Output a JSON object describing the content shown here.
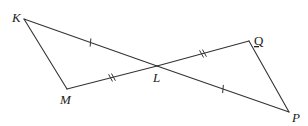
{
  "diagram": {
    "type": "geometry",
    "points": {
      "K": {
        "label": "K"
      },
      "M": {
        "label": "M"
      },
      "L": {
        "label": "L"
      },
      "Q": {
        "label": "Q"
      },
      "P": {
        "label": "P"
      }
    },
    "segments": [
      {
        "from": "K",
        "to": "L",
        "ticks": 1
      },
      {
        "from": "L",
        "to": "P",
        "ticks": 1
      },
      {
        "from": "M",
        "to": "L",
        "ticks": 2
      },
      {
        "from": "L",
        "to": "Q",
        "ticks": 2
      },
      {
        "from": "K",
        "to": "M",
        "ticks": 0
      },
      {
        "from": "Q",
        "to": "P",
        "ticks": 0
      }
    ],
    "congruences": [
      "KL ≅ LP",
      "ML ≅ LQ"
    ],
    "line_color": "#333333"
  }
}
